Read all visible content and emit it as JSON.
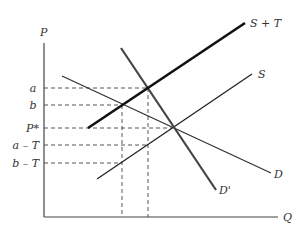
{
  "diagram": {
    "axes": {
      "y_label": "P",
      "x_label": "Q"
    },
    "price_levels": [
      {
        "id": "a",
        "label": "a",
        "y": 88
      },
      {
        "id": "b",
        "label": "b",
        "y": 105
      },
      {
        "id": "p_star",
        "label": "P*",
        "y": 128
      },
      {
        "id": "a_minus_t",
        "label": "a – T",
        "y": 145
      },
      {
        "id": "b_minus_t",
        "label": "b – T",
        "y": 163
      }
    ],
    "curves": [
      {
        "id": "s_plus_t",
        "label": "S + T",
        "weight": "thick"
      },
      {
        "id": "s",
        "label": "S",
        "weight": "normal"
      },
      {
        "id": "d",
        "label": "D",
        "weight": "normal"
      },
      {
        "id": "d_prime",
        "label": "D'",
        "weight": "medium"
      }
    ],
    "colors": {
      "line": "#222222",
      "axis": "#444444",
      "dash": "#555555",
      "text": "#333333"
    }
  }
}
